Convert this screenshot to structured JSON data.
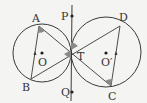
{
  "diagram": {
    "colors": {
      "background": "#f4f4f2",
      "stroke": "#3a3a3a",
      "shade": "#8a8a8a"
    },
    "circles": [
      {
        "name": "O",
        "cx": 42,
        "cy": 53,
        "r": 29
      },
      {
        "name": "O'",
        "cx": 106,
        "cy": 52,
        "r": 35
      }
    ],
    "points": {
      "A": {
        "x": 39,
        "y": 26,
        "label": "A",
        "lx": 31,
        "ly": 21
      },
      "B": {
        "x": 31,
        "y": 79,
        "label": "B",
        "lx": 22,
        "ly": 91
      },
      "C": {
        "x": 111,
        "y": 86,
        "label": "C",
        "lx": 108,
        "ly": 100
      },
      "D": {
        "x": 120,
        "y": 26,
        "label": "D",
        "lx": 119,
        "ly": 21
      },
      "T": {
        "x": 71,
        "y": 50,
        "label": "T",
        "lx": 77,
        "ly": 59
      },
      "P": {
        "x": 72,
        "y": 16,
        "label": "P",
        "lx": 61,
        "ly": 20
      },
      "Q": {
        "x": 72,
        "y": 92,
        "label": "Q",
        "lx": 61,
        "ly": 96
      },
      "O": {
        "label": "O",
        "lx": 38,
        "ly": 66
      },
      "O'": {
        "label": "O′",
        "lx": 101,
        "ly": 66
      }
    },
    "labels": {
      "A": "A",
      "B": "B",
      "C": "C",
      "D": "D",
      "T": "T",
      "P": "P",
      "Q": "Q",
      "O": "O",
      "O2": "O′"
    },
    "segments": [
      "AB",
      "AC",
      "BD",
      "DC",
      "PQ"
    ]
  }
}
